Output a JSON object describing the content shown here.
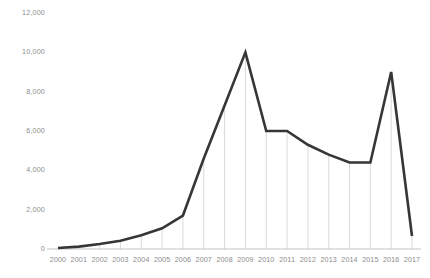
{
  "chart_data": {
    "type": "line",
    "title": "",
    "subtitle": "",
    "xlabel": "",
    "ylabel": "",
    "categories": [
      "2000",
      "2001",
      "2002",
      "2003",
      "2004",
      "2005",
      "2006",
      "2007",
      "2008",
      "2009",
      "2010",
      "2011",
      "2012",
      "2013",
      "2014",
      "2015",
      "2016",
      "2017"
    ],
    "values": [
      50,
      120,
      250,
      420,
      700,
      1050,
      1700,
      4600,
      7300,
      10000,
      6000,
      6000,
      5300,
      4800,
      4400,
      4400,
      9000,
      660
    ],
    "series": [
      {
        "name": "",
        "values": [
          50,
          120,
          250,
          420,
          700,
          1050,
          1700,
          4600,
          7300,
          10000,
          6000,
          6000,
          5300,
          4800,
          4400,
          4400,
          9000,
          660
        ]
      }
    ],
    "ylim": [
      0,
      12000
    ],
    "yticks": [
      0,
      2000,
      4000,
      6000,
      8000,
      10000,
      12000
    ],
    "ytick_labels": [
      "0",
      "2,000",
      "4,000",
      "6,000",
      "8,000",
      "10,000",
      "12,000"
    ],
    "xtick_labels": [
      "2000",
      "2001",
      "2002",
      "2003",
      "2004",
      "2005",
      "2006",
      "2007",
      "2008",
      "2009",
      "2010",
      "2011",
      "2012",
      "2013",
      "2014",
      "2015",
      "2016",
      "2017"
    ],
    "grid": "vertical-only",
    "legend": "none",
    "line_color": "#363636",
    "gridline_color": "#c9c9c9",
    "tick_text_color": "#8c8c8c",
    "background_color": "#ffffff",
    "annotations": []
  },
  "axes": {
    "y_axis": {
      "name": "y-axis",
      "ticks": [
        {
          "value": 12000,
          "label": "12,000"
        },
        {
          "value": 10000,
          "label": "10,000"
        },
        {
          "value": 8000,
          "label": "8,000"
        },
        {
          "value": 6000,
          "label": "6,000"
        },
        {
          "value": 4000,
          "label": "4,000"
        },
        {
          "value": 2000,
          "label": "2,000"
        },
        {
          "value": 0,
          "label": "0"
        }
      ]
    },
    "x_axis": {
      "name": "x-axis",
      "ticks": [
        {
          "value": 2000,
          "label": "2000"
        },
        {
          "value": 2001,
          "label": "2001"
        },
        {
          "value": 2002,
          "label": "2002"
        },
        {
          "value": 2003,
          "label": "2003"
        },
        {
          "value": 2004,
          "label": "2004"
        },
        {
          "value": 2005,
          "label": "2005"
        },
        {
          "value": 2006,
          "label": "2006"
        },
        {
          "value": 2007,
          "label": "2007"
        },
        {
          "value": 2008,
          "label": "2008"
        },
        {
          "value": 2009,
          "label": "2009"
        },
        {
          "value": 2010,
          "label": "2010"
        },
        {
          "value": 2011,
          "label": "2011"
        },
        {
          "value": 2012,
          "label": "2012"
        },
        {
          "value": 2013,
          "label": "2013"
        },
        {
          "value": 2014,
          "label": "2014"
        },
        {
          "value": 2015,
          "label": "2015"
        },
        {
          "value": 2016,
          "label": "2016"
        },
        {
          "value": 2017,
          "label": "2017"
        }
      ]
    }
  }
}
